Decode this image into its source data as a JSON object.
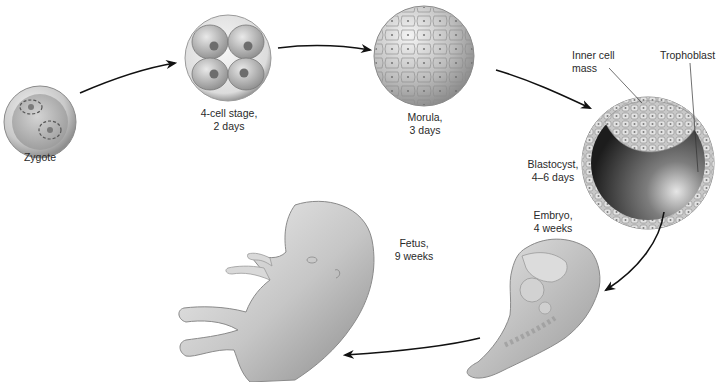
{
  "figure": {
    "stages": [
      {
        "id": "zygote",
        "name": "Zygote",
        "time": ""
      },
      {
        "id": "four-cell",
        "name": "4-cell stage,",
        "time": "2 days"
      },
      {
        "id": "morula",
        "name": "Morula,",
        "time": "3 days"
      },
      {
        "id": "blastocyst",
        "name": "Blastocyst,",
        "time": "4–6 days"
      },
      {
        "id": "embryo",
        "name": "Embryo,",
        "time": "4 weeks"
      },
      {
        "id": "fetus",
        "name": "Fetus,",
        "time": "9 weeks"
      }
    ],
    "callouts": {
      "inner_cell_mass": {
        "line1": "Inner cell",
        "line2": "mass"
      },
      "trophoblast": {
        "line1": "Trophoblast"
      }
    },
    "sequence_arrows": [
      "zygote→four-cell",
      "four-cell→morula",
      "morula→blastocyst",
      "blastocyst→embryo",
      "embryo→fetus"
    ]
  }
}
